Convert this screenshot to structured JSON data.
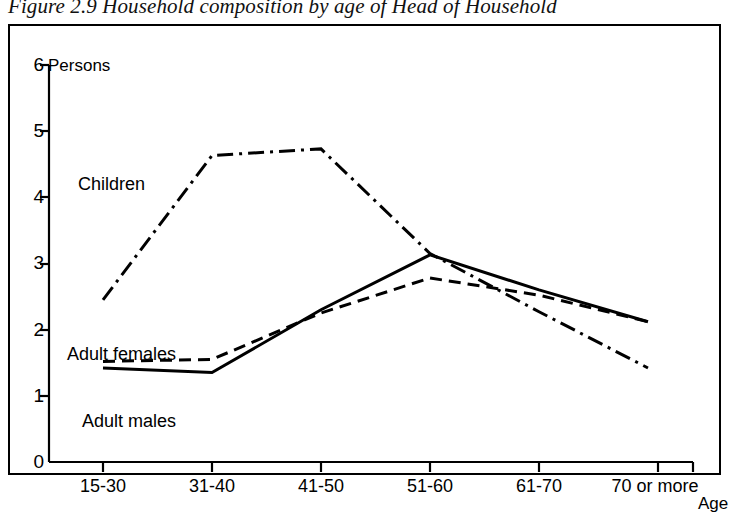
{
  "figure": {
    "title": "Figure 2.9 Household composition by age of Head of Household"
  },
  "axes": {
    "y_title": "Persons",
    "x_title": "Age",
    "y_ticks": [
      "0",
      "1",
      "2",
      "3",
      "4",
      "5",
      "6"
    ],
    "x_ticks": [
      "15-30",
      "31-40",
      "41-50",
      "51-60",
      "61-70",
      "70 or more"
    ]
  },
  "series_labels": {
    "children": "Children",
    "adult_females": "Adult females",
    "adult_males": "Adult males"
  },
  "chart_data": {
    "type": "line",
    "title": "Figure 2.9 Household composition by age of Head of Household",
    "xlabel": "Age",
    "ylabel": "Persons",
    "categories": [
      "15-30",
      "31-40",
      "41-50",
      "51-60",
      "61-70",
      "70 or more"
    ],
    "ylim": [
      0,
      6
    ],
    "yticks": [
      0,
      1,
      2,
      3,
      4,
      5,
      6
    ],
    "grid": false,
    "legend": "inline-labels",
    "series": [
      {
        "name": "Children",
        "style": "dash-dot",
        "values": [
          2.45,
          4.63,
          4.73,
          3.15,
          2.27,
          1.42
        ]
      },
      {
        "name": "Adult females",
        "style": "dashed",
        "values": [
          1.52,
          1.55,
          2.25,
          2.78,
          2.52,
          2.12
        ]
      },
      {
        "name": "Adult males",
        "style": "solid",
        "values": [
          1.42,
          1.35,
          2.3,
          3.13,
          2.6,
          2.12
        ]
      }
    ]
  }
}
